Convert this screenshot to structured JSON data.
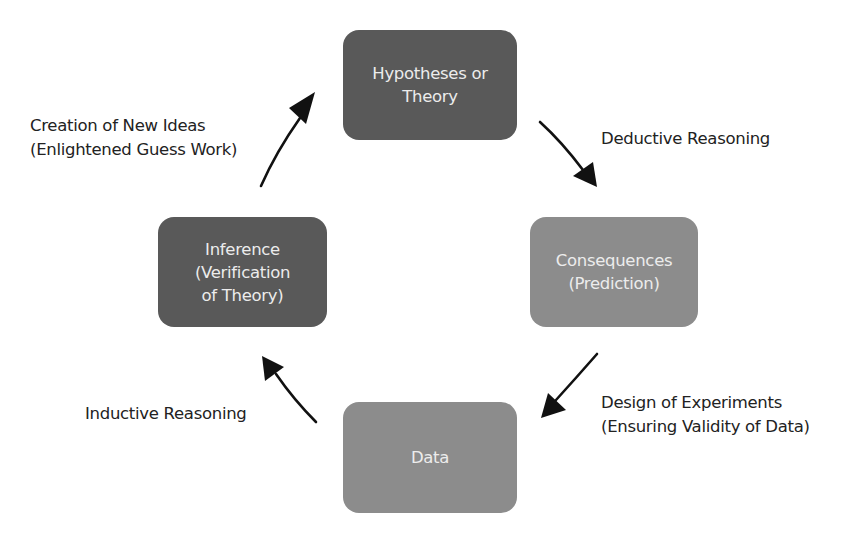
{
  "diagram": {
    "type": "cycle",
    "nodes": [
      {
        "id": "hypotheses",
        "lines": [
          "Hypotheses or",
          "Theory"
        ],
        "shade": "dark",
        "color": "#595959"
      },
      {
        "id": "consequences",
        "lines": [
          "Consequences",
          "(Prediction)"
        ],
        "shade": "light",
        "color": "#8c8c8c"
      },
      {
        "id": "data",
        "lines": [
          "Data"
        ],
        "shade": "light",
        "color": "#8c8c8c"
      },
      {
        "id": "inference",
        "lines": [
          "Inference",
          "(Verification",
          "of Theory)"
        ],
        "shade": "dark",
        "color": "#595959"
      }
    ],
    "edges": [
      {
        "from": "hypotheses",
        "to": "consequences",
        "lines": [
          "Deductive Reasoning"
        ]
      },
      {
        "from": "consequences",
        "to": "data",
        "lines": [
          "Design of Experiments",
          "(Ensuring Validity of Data)"
        ]
      },
      {
        "from": "data",
        "to": "inference",
        "lines": [
          "Inductive Reasoning"
        ]
      },
      {
        "from": "inference",
        "to": "hypotheses",
        "lines": [
          "Creation of New Ideas",
          "(Enlightened Guess Work)"
        ]
      }
    ],
    "text_color": "#222222",
    "box_text_color": "#ececec",
    "arrow_color": "#111111"
  }
}
